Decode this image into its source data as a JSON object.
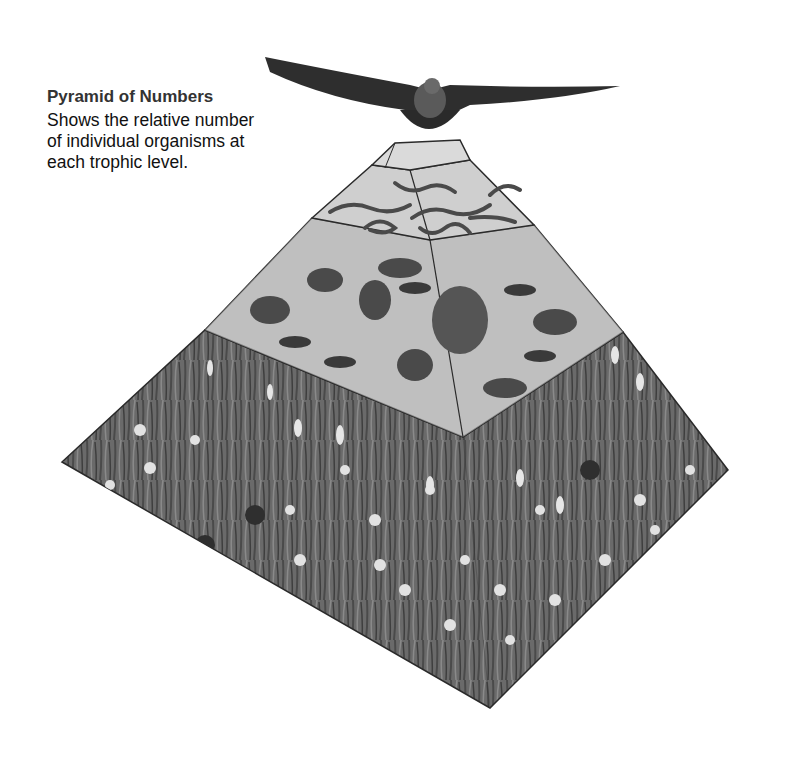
{
  "caption": {
    "title": "Pyramid of Numbers",
    "lines": [
      "Shows the relative number",
      "of individual organisms at",
      "each trophic level."
    ]
  },
  "pyramid": {
    "levels": [
      {
        "name": "tertiary-consumer",
        "organism": "hawk",
        "count": 1
      },
      {
        "name": "secondary-consumers",
        "organism": "snakes",
        "count": 7
      },
      {
        "name": "primary-consumers",
        "organism": "mice, rabbit, grasshoppers",
        "count": 15
      },
      {
        "name": "producers",
        "organism": "grasses and wildflowers",
        "count": "many"
      }
    ],
    "colors": {
      "face_light": "#d2d2d2",
      "face_mid": "#bdbdbd",
      "grass": "#6a6a6a",
      "grass_dark": "#3e3e3e",
      "edge": "#2a2a2a",
      "flower": "#e2e2e2"
    }
  }
}
